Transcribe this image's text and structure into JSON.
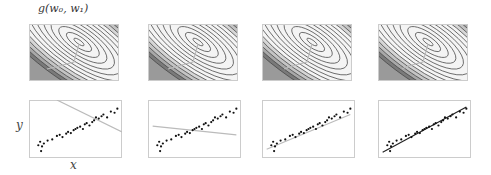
{
  "title": "g(w₀, w₁)",
  "axis_labels": {
    "y": "y",
    "x": "x"
  },
  "panels": [
    {
      "contour_left": 29,
      "scatter_left": 29,
      "line": {
        "x1": 0.3,
        "y1": 0.0,
        "x2": 1.0,
        "y2": 0.55
      },
      "point": [
        0.52,
        0.62
      ]
    },
    {
      "contour_left": 148,
      "scatter_left": 148,
      "line": {
        "x1": 0.05,
        "y1": 0.45,
        "x2": 0.95,
        "y2": 0.6
      },
      "point": [
        0.55,
        0.58
      ]
    },
    {
      "contour_left": 262,
      "scatter_left": 262,
      "line": {
        "x1": 0.05,
        "y1": 0.85,
        "x2": 0.95,
        "y2": 0.25
      },
      "point": [
        0.6,
        0.57
      ]
    },
    {
      "contour_left": 378,
      "scatter_left": 378,
      "line": {
        "x1": 0.05,
        "y1": 0.9,
        "x2": 0.95,
        "y2": 0.12
      },
      "point": [
        0.5,
        0.35
      ]
    }
  ]
}
